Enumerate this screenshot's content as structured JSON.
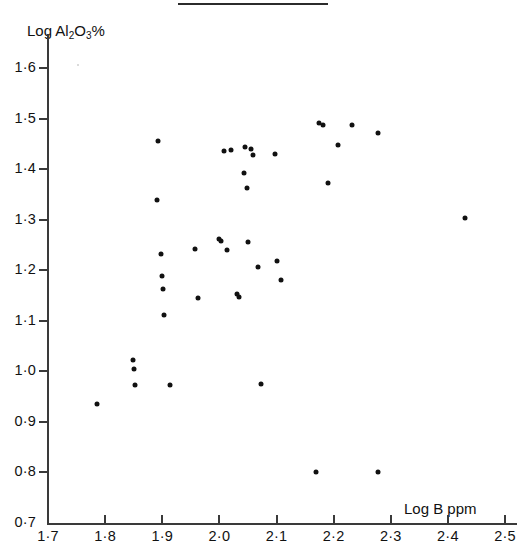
{
  "figure": {
    "background_color": "#ffffff",
    "ink_color": "#111111",
    "top_rule": true
  },
  "axes": {
    "y_title": "Log Al",
    "y_title_sub1": "2",
    "y_title_mid": "O",
    "y_title_sub2": "3",
    "y_title_suffix": "%",
    "x_title": "Log B ppm",
    "x_ticks": [
      "1·7",
      "1·8",
      "1·9",
      "2·0",
      "2·1",
      "2·2",
      "2·3",
      "2·4",
      "2·5"
    ],
    "y_ticks": [
      "1·6",
      "1·5",
      "1·4",
      "1·3",
      "1·2",
      "1·1",
      "1·0",
      "0·9",
      "0·8",
      "0·7"
    ]
  },
  "chart_data": {
    "type": "scatter",
    "title": "",
    "xlabel": "Log B ppm",
    "ylabel": "Log Al2O3%",
    "xlim": [
      1.7,
      2.5
    ],
    "ylim": [
      0.7,
      1.6
    ],
    "xticks": [
      1.7,
      1.8,
      1.9,
      2.0,
      2.1,
      2.2,
      2.3,
      2.4,
      2.5
    ],
    "yticks": [
      0.7,
      0.8,
      0.9,
      1.0,
      1.1,
      1.2,
      1.3,
      1.4,
      1.5,
      1.6
    ],
    "grid": false,
    "legend": false,
    "marker": "filled-circle",
    "marker_color": "#111111",
    "n_points": 40,
    "points": [
      {
        "x": 1.785,
        "y": 0.935
      },
      {
        "x": 1.848,
        "y": 1.022
      },
      {
        "x": 1.85,
        "y": 1.005
      },
      {
        "x": 1.852,
        "y": 0.972
      },
      {
        "x": 1.893,
        "y": 1.455
      },
      {
        "x": 1.89,
        "y": 1.338
      },
      {
        "x": 1.898,
        "y": 1.232
      },
      {
        "x": 1.9,
        "y": 1.188
      },
      {
        "x": 1.902,
        "y": 1.162
      },
      {
        "x": 1.903,
        "y": 1.112
      },
      {
        "x": 1.913,
        "y": 0.972
      },
      {
        "x": 1.962,
        "y": 1.146
      },
      {
        "x": 2.008,
        "y": 1.435
      },
      {
        "x": 2.02,
        "y": 1.438
      },
      {
        "x": 2.002,
        "y": 1.258
      },
      {
        "x": 2.013,
        "y": 1.24
      },
      {
        "x": 2.03,
        "y": 1.152
      },
      {
        "x": 2.043,
        "y": 1.392
      },
      {
        "x": 2.045,
        "y": 1.443
      },
      {
        "x": 2.048,
        "y": 1.363
      },
      {
        "x": 2.05,
        "y": 1.255
      },
      {
        "x": 2.058,
        "y": 1.428
      },
      {
        "x": 2.068,
        "y": 1.207
      },
      {
        "x": 2.073,
        "y": 0.975
      },
      {
        "x": 2.098,
        "y": 1.43
      },
      {
        "x": 2.1,
        "y": 1.218
      },
      {
        "x": 2.108,
        "y": 1.18
      },
      {
        "x": 2.17,
        "y": 0.8
      },
      {
        "x": 2.175,
        "y": 1.492
      },
      {
        "x": 2.182,
        "y": 1.487
      },
      {
        "x": 2.19,
        "y": 1.373
      },
      {
        "x": 2.208,
        "y": 1.447
      },
      {
        "x": 2.232,
        "y": 1.488
      },
      {
        "x": 2.277,
        "y": 1.472
      },
      {
        "x": 2.278,
        "y": 0.8
      },
      {
        "x": 2.43,
        "y": 1.303
      },
      {
        "x": 1.958,
        "y": 1.242
      },
      {
        "x": 2.0,
        "y": 1.262
      },
      {
        "x": 2.034,
        "y": 1.148
      },
      {
        "x": 2.055,
        "y": 1.44
      }
    ]
  }
}
